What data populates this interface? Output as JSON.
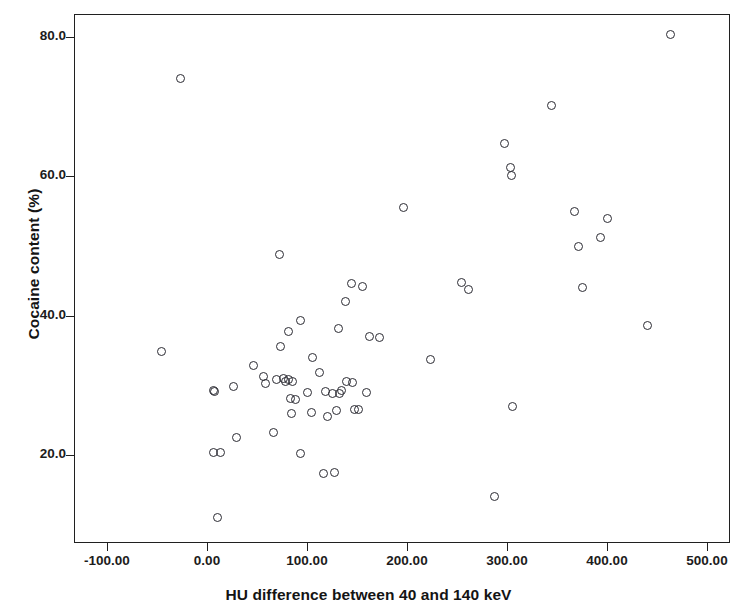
{
  "chart_data": {
    "type": "scatter",
    "title": "",
    "xlabel": "HU difference between 40 and 140 keV",
    "ylabel": "Cocaine content (%)",
    "xlim": [
      -148,
      510
    ],
    "ylim": [
      7.4,
      83.3
    ],
    "grid": false,
    "legend": null,
    "marker": "open-circle",
    "marker_color": "#2b2b33",
    "xticks": [
      -100,
      0,
      100,
      200,
      300,
      400,
      500
    ],
    "xtick_labels": [
      "-100.00",
      "0.00",
      "100.00",
      "200.00",
      "300.00",
      "400.00",
      "500.00"
    ],
    "yticks": [
      20,
      40,
      60,
      80
    ],
    "ytick_labels": [
      "20.0",
      "40.0",
      "60.0",
      "80.0"
    ],
    "n_points": 66,
    "points": [
      {
        "x": -27,
        "y": 74.0
      },
      {
        "x": -46,
        "y": 34.8
      },
      {
        "x": 6,
        "y": 29.2
      },
      {
        "x": 6,
        "y": 20.3
      },
      {
        "x": 13,
        "y": 20.3
      },
      {
        "x": 10,
        "y": 11.0
      },
      {
        "x": 7,
        "y": 29.1
      },
      {
        "x": 26,
        "y": 29.8
      },
      {
        "x": 29,
        "y": 22.5
      },
      {
        "x": 46,
        "y": 32.9
      },
      {
        "x": 69,
        "y": 30.9
      },
      {
        "x": 72,
        "y": 48.8
      },
      {
        "x": 73,
        "y": 35.6
      },
      {
        "x": 76,
        "y": 31.0
      },
      {
        "x": 78,
        "y": 30.6
      },
      {
        "x": 81,
        "y": 30.8
      },
      {
        "x": 66,
        "y": 23.2
      },
      {
        "x": 81,
        "y": 37.7
      },
      {
        "x": 84,
        "y": 26.0
      },
      {
        "x": 88,
        "y": 28.0
      },
      {
        "x": 93,
        "y": 39.3
      },
      {
        "x": 93,
        "y": 20.2
      },
      {
        "x": 104,
        "y": 26.1
      },
      {
        "x": 105,
        "y": 34.0
      },
      {
        "x": 116,
        "y": 17.4
      },
      {
        "x": 118,
        "y": 29.1
      },
      {
        "x": 125,
        "y": 28.8
      },
      {
        "x": 132,
        "y": 28.8
      },
      {
        "x": 134,
        "y": 29.3
      },
      {
        "x": 139,
        "y": 30.5
      },
      {
        "x": 145,
        "y": 30.4
      },
      {
        "x": 147,
        "y": 26.6
      },
      {
        "x": 151,
        "y": 26.5
      },
      {
        "x": 127,
        "y": 17.5
      },
      {
        "x": 131,
        "y": 38.1
      },
      {
        "x": 138,
        "y": 42.1
      },
      {
        "x": 155,
        "y": 44.2
      },
      {
        "x": 144,
        "y": 44.6
      },
      {
        "x": 159,
        "y": 29.0
      },
      {
        "x": 162,
        "y": 37.0
      },
      {
        "x": 172,
        "y": 36.8
      },
      {
        "x": 196,
        "y": 55.5
      },
      {
        "x": 223,
        "y": 33.7
      },
      {
        "x": 254,
        "y": 44.7
      },
      {
        "x": 261,
        "y": 43.7
      },
      {
        "x": 287,
        "y": 14.1
      },
      {
        "x": 297,
        "y": 64.7
      },
      {
        "x": 303,
        "y": 61.3
      },
      {
        "x": 304,
        "y": 60.1
      },
      {
        "x": 305,
        "y": 27.0
      },
      {
        "x": 344,
        "y": 70.1
      },
      {
        "x": 367,
        "y": 54.9
      },
      {
        "x": 371,
        "y": 49.9
      },
      {
        "x": 375,
        "y": 44.0
      },
      {
        "x": 393,
        "y": 51.2
      },
      {
        "x": 400,
        "y": 54.0
      },
      {
        "x": 440,
        "y": 38.6
      },
      {
        "x": 463,
        "y": 80.4
      },
      {
        "x": 56,
        "y": 31.3
      },
      {
        "x": 85,
        "y": 30.6
      },
      {
        "x": 112,
        "y": 31.8
      },
      {
        "x": 120,
        "y": 25.5
      },
      {
        "x": 58,
        "y": 30.2
      },
      {
        "x": 100,
        "y": 28.9
      },
      {
        "x": 83,
        "y": 28.1
      },
      {
        "x": 129,
        "y": 26.4
      }
    ]
  }
}
